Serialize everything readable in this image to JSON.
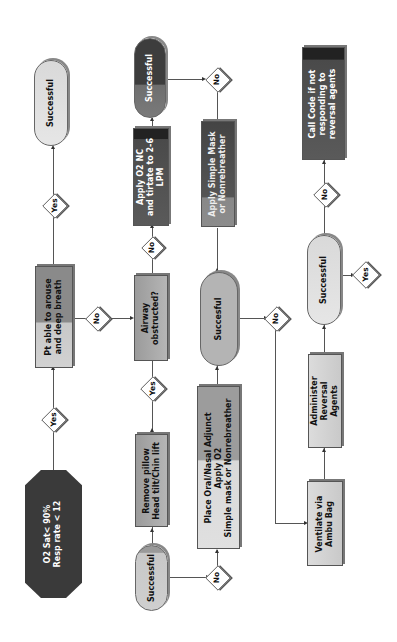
{
  "diagram": {
    "orientation": "rotated 90 degrees counter-clockwise",
    "nodes": {
      "start": {
        "line1": "O2 Sat< 90%",
        "line2": "Resp rate < 12"
      },
      "arouse": {
        "line1": "Pt able to arouse",
        "line2": "and deep breath"
      },
      "success1": {
        "label": "Successful"
      },
      "airway": {
        "line1": "Airway",
        "line2": "obstructed?"
      },
      "apply_nc": {
        "line1": "Apply O2 NC",
        "line2": "and tirtate to 2-6",
        "line3": "LPM"
      },
      "success2": {
        "label": "Successful"
      },
      "apply_mask": {
        "line1": "Apply Simple Mask",
        "line2": "or Nonrebreather"
      },
      "remove_pillow": {
        "line1": "Remove pillow",
        "line2": "Head tilt/Chin lift"
      },
      "success3": {
        "label": "Successful"
      },
      "place_adjunct": {
        "line1": "Place Oral/Nasal Adjunct",
        "line2": "Apply O2",
        "line3": "Simple mask or Nonrebreather"
      },
      "success4": {
        "label": "Succesful"
      },
      "ventilate": {
        "line1": "Ventilate via",
        "line2": "Ambu Bag"
      },
      "reversal": {
        "line1": "Administer",
        "line2": "Reversal",
        "line3": "Agents"
      },
      "success5": {
        "label": "Successful"
      },
      "call_code": {
        "line1": "Call Code if not",
        "line2": "responding to",
        "line3": "reversal agents"
      }
    },
    "decisions": {
      "yes": "Yes",
      "no": "No"
    }
  }
}
